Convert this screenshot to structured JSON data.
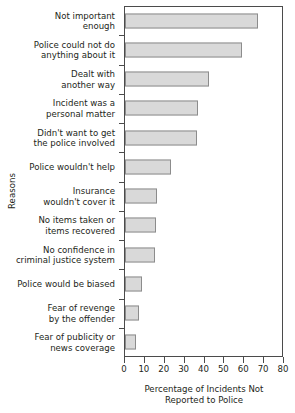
{
  "chart_data": {
    "type": "bar",
    "orientation": "horizontal",
    "title": "",
    "xlabel": "Percentage of Incidents Not Reported to Police",
    "xlabel_lines": [
      "Percentage of Incidents Not",
      "Reported to Police"
    ],
    "ylabel": "Reasons",
    "xlim": [
      0,
      80
    ],
    "xticks": [
      0,
      10,
      20,
      30,
      40,
      50,
      60,
      70,
      80
    ],
    "xticklabels": [
      "0",
      "10",
      "20",
      "30",
      "40",
      "50",
      "60",
      "70",
      "80"
    ],
    "grid": false,
    "legend": false,
    "bar_color": "#d9d9d9",
    "bar_edge_color": "#8c8c8c",
    "axis_color": "#4b4b4b",
    "categories": [
      "Not important enough",
      "Police could not do anything about it",
      "Dealt with another way",
      "Incident was a personal matter",
      "Didn't want to get the police involved",
      "Police wouldn't help",
      "Insurance wouldn't cover it",
      "No items taken or items recovered",
      "No confidence in criminal justice system",
      "Police would be biased",
      "Fear of revenge by the offender",
      "Fear of publicity or news coverage"
    ],
    "category_lines": [
      [
        "Not important",
        "enough"
      ],
      [
        "Police could not do",
        "anything about it"
      ],
      [
        "Dealt with",
        "another way"
      ],
      [
        "Incident was a",
        "personal matter"
      ],
      [
        "Didn't want to get",
        "the police involved"
      ],
      [
        "Police wouldn't help"
      ],
      [
        "Insurance",
        "wouldn't cover it"
      ],
      [
        "No items taken or",
        "items recovered"
      ],
      [
        "No confidence in",
        "criminal justice system"
      ],
      [
        "Police would be biased"
      ],
      [
        "Fear of revenge",
        "by the offender"
      ],
      [
        "Fear of publicity or",
        "news coverage"
      ]
    ],
    "values": [
      67,
      59,
      42.5,
      36.5,
      36,
      23,
      16,
      15.5,
      15,
      8.5,
      7,
      5.5
    ]
  }
}
